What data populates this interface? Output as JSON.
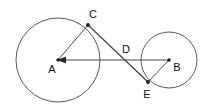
{
  "figure": {
    "background_color": "#ffffff",
    "stroke_color": "#4a4a4a",
    "label_color": "#111111",
    "width": 210,
    "height": 110,
    "circles": [
      {
        "id": "circle-a",
        "center_label": "A",
        "cx": 58,
        "cy": 60,
        "r": 42
      },
      {
        "id": "circle-b",
        "center_label": "B",
        "cx": 169,
        "cy": 60,
        "r": 28
      }
    ],
    "points": [
      {
        "id": "point-a",
        "label": "A",
        "x": 58,
        "y": 60,
        "label_x": 52,
        "label_y": 70,
        "dot": true
      },
      {
        "id": "point-b",
        "label": "B",
        "x": 169,
        "y": 60,
        "label_x": 177,
        "label_y": 68,
        "dot": true
      },
      {
        "id": "point-c",
        "label": "C",
        "x": 88,
        "y": 25,
        "label_x": 93,
        "label_y": 15,
        "dot": true
      },
      {
        "id": "point-d",
        "label": "D",
        "x": 122,
        "y": 60,
        "label_x": 126,
        "label_y": 50,
        "dot": false
      },
      {
        "id": "point-e",
        "label": "E",
        "x": 148,
        "y": 82,
        "label_x": 147,
        "label_y": 95,
        "dot": true
      }
    ],
    "segments": [
      {
        "id": "segment-ac",
        "from": "A",
        "to": "C",
        "x1": 58,
        "y1": 60,
        "x2": 88,
        "y2": 25
      },
      {
        "id": "segment-ab",
        "from": "B",
        "to": "A",
        "x1": 169,
        "y1": 60,
        "x2": 58,
        "y2": 60,
        "arrow_at": "A"
      },
      {
        "id": "segment-ce",
        "from": "C",
        "to": "E",
        "x1": 88,
        "y1": 25,
        "x2": 148,
        "y2": 82
      },
      {
        "id": "segment-be",
        "from": "B",
        "to": "E",
        "x1": 169,
        "y1": 60,
        "x2": 148,
        "y2": 82
      }
    ]
  }
}
